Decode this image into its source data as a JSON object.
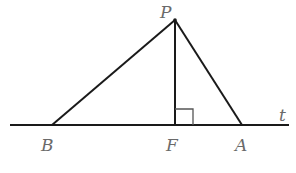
{
  "figure": {
    "type": "geometry",
    "points": {
      "P": {
        "label": "P",
        "x": 175,
        "y": 20
      },
      "B": {
        "label": "B",
        "x": 52,
        "y": 125
      },
      "F": {
        "label": "F",
        "x": 175,
        "y": 125
      },
      "A": {
        "label": "A",
        "x": 242,
        "y": 125
      }
    },
    "line_t": {
      "label": "t",
      "x1": 10,
      "x2": 289,
      "y": 125
    },
    "segments": [
      {
        "from": "P",
        "to": "B"
      },
      {
        "from": "P",
        "to": "A"
      },
      {
        "from": "P",
        "to": "F"
      }
    ],
    "right_angle_marker": {
      "at": "F",
      "size": 16
    },
    "labels": {
      "P": "P",
      "B": "B",
      "F": "F",
      "A": "A",
      "t": "t"
    }
  }
}
